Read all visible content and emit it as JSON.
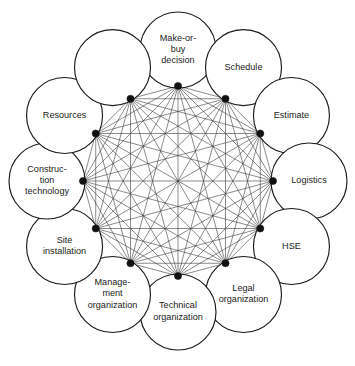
{
  "diagram": {
    "type": "complete-graph-circular",
    "geometry": {
      "center_x": 178,
      "center_y": 181,
      "node_ring_radius": 131,
      "node_circle_radius": 38,
      "hub_ring_radius": 95,
      "hub_dot_radius": 3.6
    },
    "style": {
      "background": "#ffffff",
      "node_fill": "#ffffff",
      "node_stroke": "#1a1a1a",
      "edge_stroke": "#3c3c3c",
      "hub_fill": "#111111",
      "label_color": "#1a1a1a"
    },
    "nodes": [
      {
        "id": "make-or-buy-decision",
        "label": "Make-or-buy decision",
        "lines": [
          "Make-or-",
          "buy",
          "decision"
        ],
        "angle_deg": 90
      },
      {
        "id": "schedule",
        "label": "Schedule",
        "lines": [
          "Schedule"
        ],
        "angle_deg": 60
      },
      {
        "id": "estimate",
        "label": "Estimate",
        "lines": [
          "Estimate"
        ],
        "angle_deg": 30
      },
      {
        "id": "logistics",
        "label": "Logistics",
        "lines": [
          "Logistics"
        ],
        "angle_deg": 0
      },
      {
        "id": "hse",
        "label": "HSE",
        "lines": [
          "HSE"
        ],
        "angle_deg": -30
      },
      {
        "id": "legal-organization",
        "label": "Legal organization",
        "lines": [
          "Legal",
          "organization"
        ],
        "angle_deg": -60
      },
      {
        "id": "technical-organization",
        "label": "Technical organization",
        "lines": [
          "Technical",
          "organization"
        ],
        "angle_deg": -90
      },
      {
        "id": "management-organization",
        "label": "Management organization",
        "lines": [
          "Manage-",
          "ment",
          "organization"
        ],
        "angle_deg": -120
      },
      {
        "id": "site-installation",
        "label": "Site installation",
        "lines": [
          "Site",
          "installation"
        ],
        "angle_deg": -150
      },
      {
        "id": "construction-technology",
        "label": "Construction technology",
        "lines": [
          "Construc-",
          "tion",
          "technology"
        ],
        "angle_deg": 180
      },
      {
        "id": "resources",
        "label": "Resources",
        "lines": [
          "Resources"
        ],
        "angle_deg": 150
      },
      {
        "id": "make-or-buy-neighbor-gap",
        "label": "",
        "lines": [],
        "angle_deg": 120,
        "placeholder": true
      }
    ],
    "node_order": [
      "make-or-buy-decision",
      "schedule",
      "estimate",
      "logistics",
      "hse",
      "legal-organization",
      "technical-organization",
      "management-organization",
      "site-installation",
      "construction-technology",
      "resources"
    ],
    "edges_description": "Every hub is connected to every other hub (complete graph, 66 edges among 12 nodes).",
    "adjacent_rim_links": 12
  }
}
